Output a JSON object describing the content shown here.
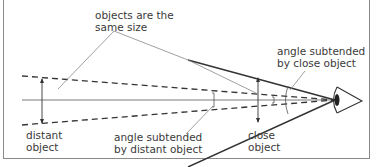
{
  "diagram": {
    "labels": {
      "same_size_1": "objects are the",
      "same_size_2": "same size",
      "close_angle_1": "angle subtended",
      "close_angle_2": "by close object",
      "distant_1": "distant",
      "distant_2": "object",
      "distant_angle_1": "angle subtended",
      "distant_angle_2": "by distant object",
      "close_1": "close",
      "close_2": "object"
    },
    "colors": {
      "line": "#333333",
      "thin": "#777777",
      "frame": "#8a8a8a",
      "text": "#3a3a3a"
    }
  }
}
